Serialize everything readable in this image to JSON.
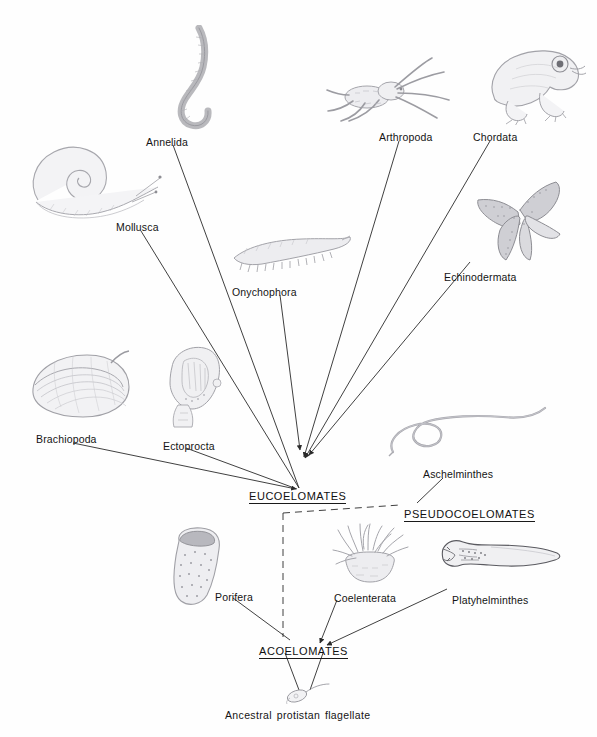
{
  "figure": {
    "type": "phylogenetic-tree",
    "background_color": "#fefefe",
    "line_color": "#2a2a2a",
    "text_color": "#141414"
  },
  "nodes": [
    {
      "id": "eucoelomates",
      "label": "EUCOELOMATES",
      "x": 249,
      "y": 490
    },
    {
      "id": "pseudocoelomates",
      "label": "PSEUDOCOELOMATES",
      "x": 404,
      "y": 508
    },
    {
      "id": "acoelomates",
      "label": "ACOELOMATES",
      "x": 259,
      "y": 645
    }
  ],
  "taxa": [
    {
      "id": "annelida",
      "label": "Annelida",
      "x": 146,
      "y": 136
    },
    {
      "id": "mollusca",
      "label": "Mollusca",
      "x": 116,
      "y": 221
    },
    {
      "id": "arthropoda",
      "label": "Arthropoda",
      "x": 379,
      "y": 131
    },
    {
      "id": "chordata",
      "label": "Chordata",
      "x": 473,
      "y": 131
    },
    {
      "id": "onychophora",
      "label": "Onychophora",
      "x": 232,
      "y": 286
    },
    {
      "id": "echinodermata",
      "label": "Echinodermata",
      "x": 444,
      "y": 271
    },
    {
      "id": "brachiopoda",
      "label": "Brachiopoda",
      "x": 36,
      "y": 433
    },
    {
      "id": "ectoprocta",
      "label": "Ectoprocta",
      "x": 163,
      "y": 440
    },
    {
      "id": "aschelminthes",
      "label": "Aschelminthes",
      "x": 423,
      "y": 468
    },
    {
      "id": "porifera",
      "label": "Porifera",
      "x": 215,
      "y": 591
    },
    {
      "id": "coelenterata",
      "label": "Coelenterata",
      "x": 334,
      "y": 592
    },
    {
      "id": "platyhelminthes",
      "label": "Platyhelminthes",
      "x": 452,
      "y": 594
    }
  ],
  "caption": {
    "text": "Ancestral protistan flagellate",
    "x": 225,
    "y": 709
  },
  "connectors": [
    {
      "from": "annelida",
      "to": "eucoelomates",
      "style": "solid",
      "arrow": false,
      "points": "173,145 299,488"
    },
    {
      "from": "mollusca",
      "to": "eucoelomates",
      "style": "solid",
      "arrow": false,
      "points": "141,231 299,488"
    },
    {
      "from": "arthropoda",
      "to": "eucoelomates",
      "style": "solid",
      "arrow": true,
      "points": "399,141 304,457"
    },
    {
      "from": "chordata",
      "to": "eucoelomates",
      "style": "solid",
      "arrow": true,
      "points": "490,141 305,458"
    },
    {
      "from": "onychophora",
      "to": "eucoelomates",
      "style": "solid",
      "arrow": true,
      "points": "280,295 300,450"
    },
    {
      "from": "echinodermata",
      "to": "eucoelomates",
      "style": "solid",
      "arrow": true,
      "points": "470,262 309,455"
    },
    {
      "from": "brachiopoda",
      "to": "eucoelomates",
      "style": "solid",
      "arrow": true,
      "points": "73,443 296,489"
    },
    {
      "from": "ectoprocta",
      "to": "eucoelomates",
      "style": "solid",
      "arrow": false,
      "points": "186,448 297,489"
    },
    {
      "from": "aschelminthes",
      "to": "pseudocoelomates",
      "style": "solid",
      "arrow": false,
      "points": "443,478 417,503"
    },
    {
      "from": "eucoelomates",
      "to": "pseudocoelomates",
      "style": "dashed",
      "arrow": false,
      "points": "283,513 400,505"
    },
    {
      "from": "eucoelomates",
      "to": "acoelomates",
      "style": "dashed",
      "arrow": false,
      "points": "283,513 283,637"
    },
    {
      "from": "porifera",
      "to": "acoelomates",
      "style": "solid",
      "arrow": false,
      "points": "233,598 290,640"
    },
    {
      "from": "coelenterata",
      "to": "acoelomates",
      "style": "solid",
      "arrow": true,
      "points": "337,600 320,643"
    },
    {
      "from": "platyhelminthes",
      "to": "acoelomates",
      "style": "solid",
      "arrow": true,
      "points": "447,589 327,645"
    },
    {
      "from": "acoelomates",
      "to": "flagellate-left",
      "style": "solid",
      "arrow": false,
      "points": "285,653 299,690"
    },
    {
      "from": "acoelomates",
      "to": "flagellate-right",
      "style": "solid",
      "arrow": false,
      "points": "323,653 310,690"
    }
  ],
  "illustrations": [
    {
      "id": "annelida-worm",
      "name": "earthworm-illustration",
      "x": 165,
      "y": 25,
      "w": 60,
      "h": 105
    },
    {
      "id": "mollusca-snail",
      "name": "snail-illustration",
      "x": 20,
      "y": 140,
      "w": 145,
      "h": 85
    },
    {
      "id": "arthropoda-spider",
      "name": "spider-illustration",
      "x": 325,
      "y": 55,
      "w": 130,
      "h": 70
    },
    {
      "id": "chordata-frog",
      "name": "frog-illustration",
      "x": 482,
      "y": 35,
      "w": 105,
      "h": 90
    },
    {
      "id": "onychophora-velvetworm",
      "name": "velvet-worm-illustration",
      "x": 230,
      "y": 232,
      "w": 125,
      "h": 45
    },
    {
      "id": "echinodermata-star",
      "name": "sea-star-illustration",
      "x": 468,
      "y": 180,
      "w": 105,
      "h": 85
    },
    {
      "id": "brachiopoda-shell",
      "name": "brachiopod-illustration",
      "x": 25,
      "y": 345,
      "w": 110,
      "h": 80
    },
    {
      "id": "ectoprocta-zooid",
      "name": "ectoproct-illustration",
      "x": 160,
      "y": 343,
      "w": 70,
      "h": 90
    },
    {
      "id": "aschelminthes-nematode",
      "name": "nematode-illustration",
      "x": 385,
      "y": 405,
      "w": 165,
      "h": 55
    },
    {
      "id": "porifera-sponge",
      "name": "sponge-illustration",
      "x": 167,
      "y": 525,
      "w": 62,
      "h": 85
    },
    {
      "id": "coelenterata-anemone",
      "name": "sea-anemone-illustration",
      "x": 330,
      "y": 522,
      "w": 80,
      "h": 65
    },
    {
      "id": "platyhelminthes-worm",
      "name": "flatworm-illustration",
      "x": 437,
      "y": 535,
      "w": 130,
      "h": 40
    },
    {
      "id": "flagellate",
      "name": "flagellate-illustration",
      "x": 283,
      "y": 683,
      "w": 50,
      "h": 22
    }
  ]
}
